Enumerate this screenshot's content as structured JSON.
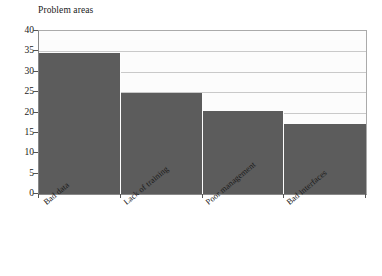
{
  "chart_data": {
    "type": "bar",
    "title": "Problem areas",
    "xlabel": "",
    "ylabel": "",
    "categories": [
      "Bad data",
      "Lack of training",
      "Poor management",
      "Bad interfaces"
    ],
    "values": [
      34.7,
      24.7,
      20.4,
      17.3
    ],
    "ylim": [
      0,
      40
    ],
    "ytick_labels": [
      "0",
      "5",
      "10",
      "15",
      "20",
      "25",
      "30",
      "35",
      "40"
    ],
    "ytick_values": [
      0,
      5,
      10,
      15,
      20,
      25,
      30,
      35,
      40
    ],
    "grid": "horizontal",
    "legend": "none",
    "bar_color": "#5c5c5c",
    "grid_color": "#c9c9c9",
    "plot_background": "#fcfcfc",
    "axis_color": "#555555",
    "text_color": "#1a1a1a"
  }
}
